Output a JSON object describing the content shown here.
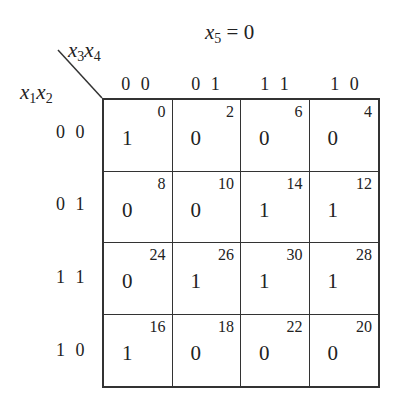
{
  "title": {
    "var": "x",
    "sub": "5",
    "eq": " = 0"
  },
  "col_var": {
    "a": "x",
    "a_sub": "3",
    "b": "x",
    "b_sub": "4"
  },
  "row_var": {
    "a": "x",
    "a_sub": "1",
    "b": "x",
    "b_sub": "2"
  },
  "col_labels": [
    "0 0",
    "0 1",
    "1 1",
    "1 0"
  ],
  "row_labels": [
    "0 0",
    "0 1",
    "1 1",
    "1 0"
  ],
  "cells": [
    [
      {
        "minterm": "0",
        "value": "1"
      },
      {
        "minterm": "2",
        "value": "0"
      },
      {
        "minterm": "6",
        "value": "0"
      },
      {
        "minterm": "4",
        "value": "0"
      }
    ],
    [
      {
        "minterm": "8",
        "value": "0"
      },
      {
        "minterm": "10",
        "value": "0"
      },
      {
        "minterm": "14",
        "value": "1"
      },
      {
        "minterm": "12",
        "value": "1"
      }
    ],
    [
      {
        "minterm": "24",
        "value": "0"
      },
      {
        "minterm": "26",
        "value": "1"
      },
      {
        "minterm": "30",
        "value": "1"
      },
      {
        "minterm": "28",
        "value": "1"
      }
    ],
    [
      {
        "minterm": "16",
        "value": "1"
      },
      {
        "minterm": "18",
        "value": "0"
      },
      {
        "minterm": "22",
        "value": "0"
      },
      {
        "minterm": "20",
        "value": "0"
      }
    ]
  ]
}
